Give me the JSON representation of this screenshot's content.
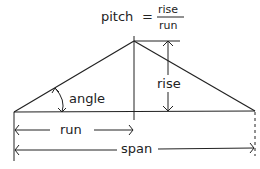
{
  "formula": {
    "lhs": "pitch",
    "equals": "=",
    "numerator": "rise",
    "denominator": "run"
  },
  "labels": {
    "angle": "angle",
    "rise": "rise",
    "run": "run",
    "span": "span"
  },
  "colors": {
    "stroke": "#222222",
    "background": "#ffffff"
  }
}
